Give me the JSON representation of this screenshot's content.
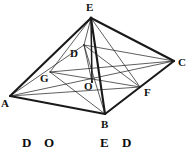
{
  "figure": {
    "type": "geometry-diagram",
    "stroke_color": "#1a1a1a",
    "background_color": "#ffffff",
    "vertices": [
      {
        "name": "E",
        "label": "E",
        "x": 91,
        "y": 18,
        "label_x": 86,
        "label_y": 2
      },
      {
        "name": "A",
        "label": "A",
        "x": 10,
        "y": 96,
        "label_x": 1,
        "label_y": 98
      },
      {
        "name": "B",
        "label": "B",
        "x": 105,
        "y": 114,
        "label_x": 101,
        "label_y": 119
      },
      {
        "name": "C",
        "label": "C",
        "x": 174,
        "y": 61,
        "label_x": 178,
        "label_y": 57
      },
      {
        "name": "D",
        "label": "D",
        "x": 84,
        "y": 45,
        "label_x": 70,
        "label_y": 48
      },
      {
        "name": "O",
        "label": "O",
        "x": 92,
        "y": 82,
        "label_x": 84,
        "label_y": 81
      },
      {
        "name": "G",
        "label": "G",
        "x": 50,
        "y": 72,
        "label_x": 40,
        "label_y": 73
      },
      {
        "name": "F",
        "label": "F",
        "x": 140,
        "y": 87,
        "label_x": 144,
        "label_y": 87
      }
    ],
    "edges": [
      {
        "name": "edge-A-B",
        "from": "A",
        "to": "B",
        "weight": "heavy"
      },
      {
        "name": "edge-B-C",
        "from": "B",
        "to": "C",
        "weight": "heavy"
      },
      {
        "name": "edge-C-D",
        "from": "C",
        "to": "D",
        "weight": "light"
      },
      {
        "name": "edge-D-A",
        "from": "D",
        "to": "A",
        "weight": "light"
      },
      {
        "name": "edge-E-A",
        "from": "E",
        "to": "A",
        "weight": "heavy"
      },
      {
        "name": "edge-E-B",
        "from": "E",
        "to": "B",
        "weight": "heavy"
      },
      {
        "name": "edge-E-C",
        "from": "E",
        "to": "C",
        "weight": "heavy"
      },
      {
        "name": "edge-E-D",
        "from": "E",
        "to": "D",
        "weight": "light"
      },
      {
        "name": "edge-E-O",
        "from": "E",
        "to": "O",
        "weight": "medium"
      },
      {
        "name": "edge-E-G",
        "from": "E",
        "to": "G",
        "weight": "light"
      },
      {
        "name": "edge-E-F",
        "from": "E",
        "to": "F",
        "weight": "light"
      },
      {
        "name": "diagonal-A-C",
        "from": "A",
        "to": "C",
        "weight": "light"
      },
      {
        "name": "diagonal-B-D",
        "from": "B",
        "to": "D",
        "weight": "light"
      },
      {
        "name": "segment-D-O",
        "from": "D",
        "to": "O",
        "weight": "light"
      },
      {
        "name": "segment-G-C",
        "from": "G",
        "to": "C",
        "weight": "light"
      },
      {
        "name": "segment-A-F",
        "from": "A",
        "to": "F",
        "weight": "light"
      },
      {
        "name": "segment-G-F",
        "from": "G",
        "to": "F",
        "weight": "light"
      },
      {
        "name": "segment-D-F",
        "from": "D",
        "to": "F",
        "weight": "light"
      },
      {
        "name": "segment-G-B",
        "from": "G",
        "to": "B",
        "weight": "light"
      }
    ]
  },
  "caption": {
    "letters": [
      {
        "name": "caption-letter-d1",
        "text": "D",
        "x": 22,
        "y": 6
      },
      {
        "name": "caption-letter-o",
        "text": "O",
        "x": 44,
        "y": 6
      },
      {
        "name": "caption-letter-e",
        "text": "E",
        "x": 100,
        "y": 6
      },
      {
        "name": "caption-letter-d2",
        "text": "D",
        "x": 122,
        "y": 6
      }
    ]
  }
}
